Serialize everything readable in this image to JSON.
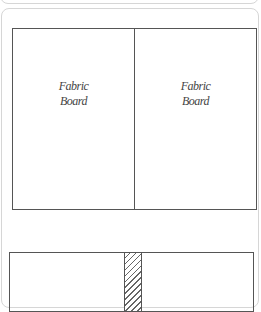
{
  "diagram_top": {
    "panels": [
      {
        "label": "Fabric\nBoard"
      },
      {
        "label": "Fabric\nBoard"
      }
    ]
  },
  "diagram_bottom": {
    "divider_pattern": "diagonal-hatch"
  },
  "colors": {
    "stroke": "#555555",
    "card_border": "#d6d6d6",
    "text": "#444444"
  }
}
